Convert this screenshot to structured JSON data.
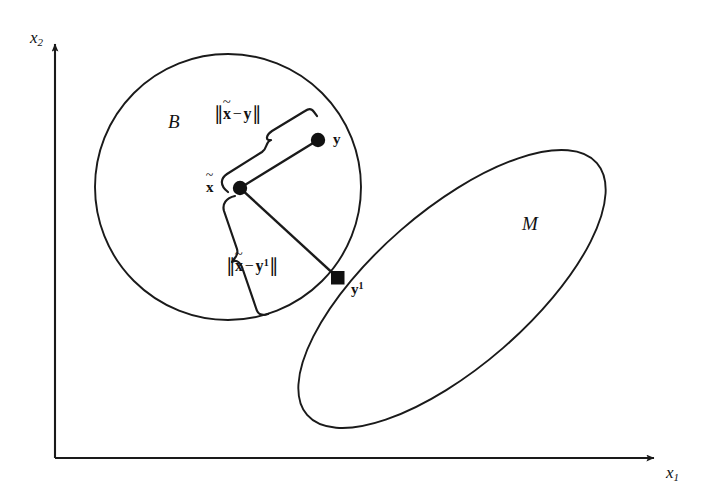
{
  "figure": {
    "background_color": "#ffffff",
    "stroke_color": "#1a1a1a",
    "axes": {
      "origin": [
        55,
        458
      ],
      "x_axis": {
        "label": "x",
        "subscript": "1",
        "label_pos": [
          668,
          468
        ],
        "tip": [
          662,
          458
        ]
      },
      "y_axis": {
        "label": "x",
        "subscript": "2",
        "label_pos": [
          30,
          30
        ],
        "tip": [
          55,
          38
        ]
      }
    },
    "shapes": [
      {
        "name": "ball-B",
        "kind": "circle",
        "label": "B",
        "label_pos": [
          168,
          112
        ],
        "center": [
          228,
          187
        ],
        "radius": 133
      },
      {
        "name": "set-M",
        "kind": "ellipse",
        "label": "M",
        "label_pos": [
          522,
          215
        ],
        "center": [
          452,
          289
        ],
        "rx": 192,
        "ry": 78,
        "rotation_deg": -41
      }
    ],
    "points": [
      {
        "name": "x-tilde",
        "label": "x",
        "accent": "tilde",
        "superscript": "",
        "marker": "disc",
        "pos": [
          240,
          188
        ],
        "label_pos": [
          208,
          182
        ]
      },
      {
        "name": "y",
        "label": "y",
        "accent": "",
        "superscript": "",
        "marker": "disc",
        "pos": [
          318,
          140
        ],
        "label_pos": [
          333,
          133
        ]
      },
      {
        "name": "y-one",
        "label": "y",
        "accent": "",
        "superscript": "1",
        "marker": "square",
        "pos": [
          338,
          278
        ],
        "label_pos": [
          352,
          283
        ]
      }
    ],
    "segments": [
      {
        "name": "segment-x-to-y",
        "from": [
          240,
          188
        ],
        "to": [
          318,
          140
        ]
      },
      {
        "name": "segment-x-to-y1",
        "from": [
          240,
          188
        ],
        "to": [
          338,
          278
        ]
      }
    ],
    "annotations": [
      {
        "name": "distance-x-y",
        "text_prefix": "x",
        "accent": "tilde",
        "operator": "−",
        "text_suffix": "y",
        "superscript": "",
        "label_pos": [
          216,
          110
        ],
        "brace_from": [
          235,
          173
        ],
        "brace_to": [
          313,
          125
        ]
      },
      {
        "name": "distance-x-y1",
        "text_prefix": "x",
        "accent": "tilde",
        "operator": "−",
        "text_suffix": "y",
        "superscript": "1",
        "label_pos": [
          228,
          262
        ],
        "brace_from": [
          228,
          200
        ],
        "brace_to": [
          326,
          290
        ]
      }
    ]
  }
}
